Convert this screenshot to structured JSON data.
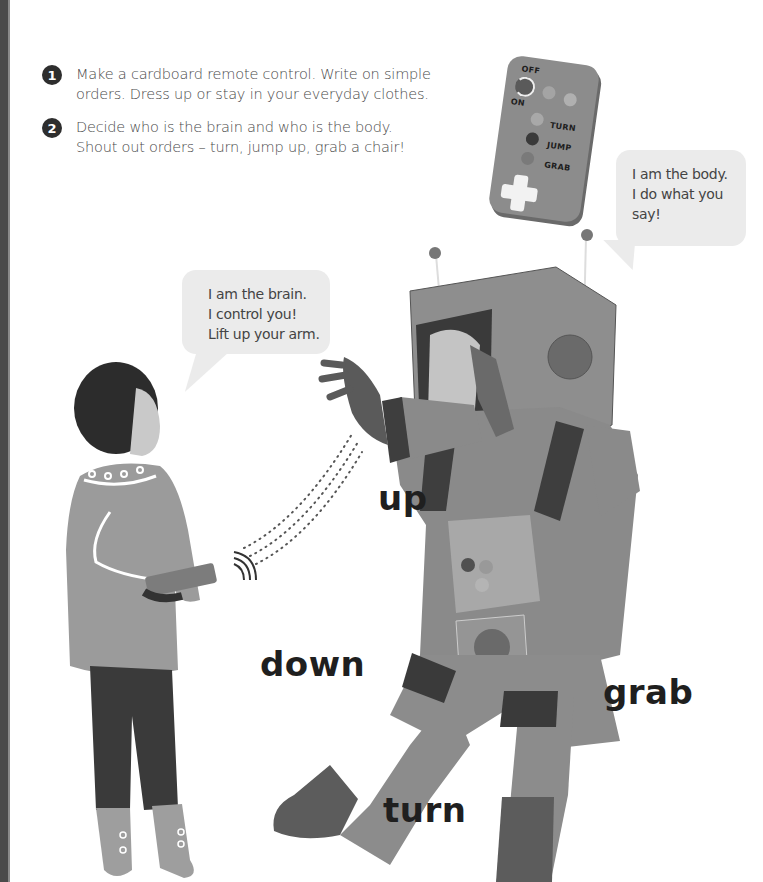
{
  "page": {
    "spine_color": "#4a4a4a",
    "background": "#ffffff"
  },
  "steps": [
    {
      "number": "1",
      "lines": [
        "Make a cardboard remote control. Write on simple",
        "orders. Dress up or stay in your everyday clothes."
      ]
    },
    {
      "number": "2",
      "lines": [
        "Decide who is the brain and who is the body.",
        "Shout out orders – turn, jump up, grab a chair!"
      ]
    }
  ],
  "remote": {
    "off_label": "OFF",
    "on_label": "ON",
    "buttons": [
      {
        "label": "TURN"
      },
      {
        "label": "JUMP"
      },
      {
        "label": "GRAB"
      }
    ]
  },
  "bubbles": {
    "body": {
      "lines": [
        "I am the body.",
        "I do what you",
        "say!"
      ]
    },
    "brain": {
      "lines": [
        "I am the brain.",
        "I control you!",
        "Lift up your arm."
      ]
    }
  },
  "commands": {
    "up": "up",
    "down": "down",
    "grab": "grab",
    "turn": "turn"
  },
  "figures": {
    "brain_child": "child-with-remote",
    "body_child": "child-in-cardboard-robot-costume"
  },
  "icons": {
    "signal": "signal-waves-icon"
  }
}
